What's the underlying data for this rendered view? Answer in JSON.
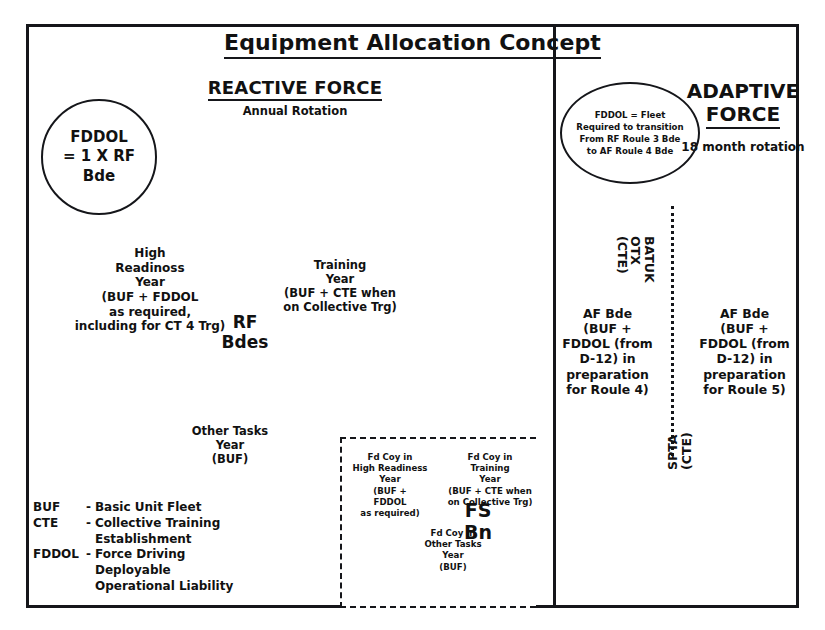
{
  "title": "Equipment Allocation Concept",
  "reactive": {
    "heading": "REACTIVE FORCE",
    "subheading": "Annual Rotation",
    "circle": "FDDOL\n= 1 X RF\nBde",
    "center_label": "RF\nBdes",
    "stages": [
      {
        "name": "high-readiness",
        "text": "High\nReadinoss\nYear\n(BUF + FDDOL\nas required,\nincluding for CT 4 Trg)"
      },
      {
        "name": "training",
        "text": "Training\nYear\n(BUF + CTE when\non Collective Trg)"
      },
      {
        "name": "other-tasks",
        "text": "Other Tasks\nYear\n(BUF)"
      }
    ]
  },
  "adaptive": {
    "heading_line1": "ADAPTIVE",
    "heading_line2": "FORCE",
    "subheading": "18 month rotation",
    "ellipse_note": "FDDOL = Fleet\nRequired to transition\nFrom RF Roule 3 Bde\nto AF Roule 4 Bde",
    "bde_left": "AF Bde\n(BUF +\nFDDOL (from\nD-12) in\npreparation\nfor Roule 4)",
    "bde_right": "AF Bde\n(BUF +\nFDDOL (from\nD-12) in\npreparation\nfor Roule 5)",
    "exercise_top": {
      "line1": "BATUK",
      "line2": "OTX",
      "line3": "(CTE)"
    },
    "exercise_bottom": {
      "line1": "SPTA",
      "line2": "(CTE)"
    }
  },
  "fs_bn": {
    "label": "FS\nBn",
    "stages": [
      {
        "name": "fd-coy-high-readiness",
        "text": "Fd Coy in\nHigh Readiness\nYear\n(BUF +\nFDDOL\nas required)"
      },
      {
        "name": "fd-coy-training",
        "text": "Fd Coy in\nTraining\nYear\n(BUF + CTE when\non Collective Trg)"
      },
      {
        "name": "fd-coy-other-tasks",
        "text": "Fd Coy in\nOther Tasks\nYear\n(BUF)"
      }
    ]
  },
  "legend": [
    {
      "abbr": "BUF",
      "dash": "-",
      "definition": "Basic Unit Fleet"
    },
    {
      "abbr": "CTE",
      "dash": "-",
      "definition": "Collective Training\nEstablishment"
    },
    {
      "abbr": "FDDOL",
      "dash": "-",
      "definition": "Force Driving\nDeployable\nOperational Liability"
    }
  ],
  "colors": {
    "ink": "#15161a",
    "arrow_fill": "#e9e9e9",
    "arrow_stroke": "#4a4a4a"
  }
}
